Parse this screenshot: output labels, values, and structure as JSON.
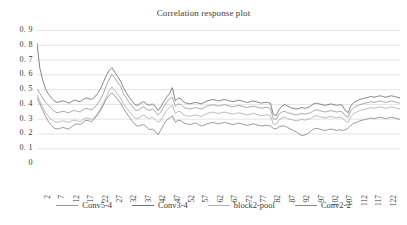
{
  "chart_data": {
    "type": "line",
    "title": "Correlation response plot",
    "xlabel": "",
    "ylabel": "",
    "ylim": [
      0,
      0.9
    ],
    "ytick_step": 0.1,
    "ytick_labels": [
      "0. 9",
      "0. 8",
      "0. 7",
      "0. 6",
      "0. 5",
      "0. 4",
      "0. 3",
      "0. 2",
      "0. 1",
      "0"
    ],
    "ytick_values": [
      0.9,
      0.8,
      0.7,
      0.6,
      0.5,
      0.4,
      0.3,
      0.2,
      0.1,
      0
    ],
    "grid": true,
    "grid_axis": "y",
    "legend_position": "bottom",
    "x_start": 1,
    "x_count": 127,
    "xtick_labels": [
      "2",
      "7",
      "12",
      "17",
      "22",
      "27",
      "32",
      "37",
      "42",
      "47",
      "52",
      "57",
      "62",
      "67",
      "72",
      "77",
      "82",
      "87",
      "92",
      "97",
      "102",
      "107",
      "112",
      "117",
      "122"
    ],
    "xtick_values": [
      2,
      7,
      12,
      17,
      22,
      27,
      32,
      37,
      42,
      47,
      52,
      57,
      62,
      67,
      72,
      77,
      82,
      87,
      92,
      97,
      102,
      107,
      112,
      117,
      122
    ],
    "series": [
      {
        "name": "Conv5-4",
        "color": "#9a9a9a",
        "values": [
          0.5,
          0.47,
          0.44,
          0.41,
          0.39,
          0.37,
          0.35,
          0.34,
          0.345,
          0.35,
          0.345,
          0.34,
          0.35,
          0.355,
          0.35,
          0.345,
          0.36,
          0.37,
          0.365,
          0.36,
          0.375,
          0.4,
          0.43,
          0.47,
          0.52,
          0.565,
          0.6,
          0.575,
          0.545,
          0.52,
          0.47,
          0.44,
          0.41,
          0.385,
          0.36,
          0.355,
          0.37,
          0.38,
          0.365,
          0.355,
          0.365,
          0.35,
          0.325,
          0.345,
          0.38,
          0.41,
          0.435,
          0.445,
          0.385,
          0.4,
          0.395,
          0.375,
          0.37,
          0.365,
          0.37,
          0.375,
          0.37,
          0.365,
          0.375,
          0.385,
          0.39,
          0.395,
          0.39,
          0.385,
          0.39,
          0.395,
          0.39,
          0.385,
          0.38,
          0.385,
          0.39,
          0.385,
          0.38,
          0.375,
          0.38,
          0.385,
          0.38,
          0.375,
          0.37,
          0.375,
          0.375,
          0.37,
          0.3,
          0.295,
          0.33,
          0.345,
          0.35,
          0.34,
          0.335,
          0.33,
          0.325,
          0.33,
          0.335,
          0.33,
          0.335,
          0.34,
          0.355,
          0.36,
          0.355,
          0.35,
          0.345,
          0.35,
          0.355,
          0.35,
          0.345,
          0.35,
          0.345,
          0.32,
          0.31,
          0.355,
          0.375,
          0.385,
          0.395,
          0.4,
          0.405,
          0.41,
          0.415,
          0.41,
          0.415,
          0.42,
          0.415,
          0.41,
          0.415,
          0.42,
          0.415,
          0.41,
          0.405
        ]
      },
      {
        "name": "Conv3-4",
        "color": "#707070",
        "values": [
          0.81,
          0.64,
          0.56,
          0.5,
          0.465,
          0.44,
          0.42,
          0.41,
          0.415,
          0.42,
          0.415,
          0.405,
          0.415,
          0.425,
          0.42,
          0.415,
          0.43,
          0.44,
          0.435,
          0.43,
          0.445,
          0.47,
          0.5,
          0.545,
          0.59,
          0.625,
          0.645,
          0.615,
          0.585,
          0.555,
          0.51,
          0.475,
          0.445,
          0.42,
          0.395,
          0.39,
          0.405,
          0.415,
          0.4,
          0.39,
          0.4,
          0.385,
          0.355,
          0.38,
          0.415,
          0.445,
          0.47,
          0.51,
          0.42,
          0.44,
          0.435,
          0.41,
          0.405,
          0.4,
          0.405,
          0.41,
          0.405,
          0.4,
          0.41,
          0.42,
          0.425,
          0.43,
          0.425,
          0.42,
          0.425,
          0.43,
          0.425,
          0.42,
          0.415,
          0.42,
          0.425,
          0.42,
          0.415,
          0.41,
          0.415,
          0.42,
          0.415,
          0.41,
          0.405,
          0.41,
          0.41,
          0.405,
          0.33,
          0.32,
          0.36,
          0.385,
          0.395,
          0.385,
          0.375,
          0.37,
          0.365,
          0.37,
          0.375,
          0.37,
          0.375,
          0.385,
          0.4,
          0.405,
          0.4,
          0.395,
          0.39,
          0.395,
          0.4,
          0.395,
          0.39,
          0.395,
          0.39,
          0.355,
          0.34,
          0.39,
          0.41,
          0.42,
          0.43,
          0.435,
          0.44,
          0.445,
          0.45,
          0.445,
          0.45,
          0.455,
          0.45,
          0.445,
          0.45,
          0.455,
          0.45,
          0.445,
          0.44
        ]
      },
      {
        "name": "block2-pool",
        "color": "#b0b0b0",
        "values": [
          0.46,
          0.42,
          0.38,
          0.34,
          0.315,
          0.295,
          0.28,
          0.275,
          0.28,
          0.285,
          0.28,
          0.275,
          0.285,
          0.29,
          0.285,
          0.28,
          0.295,
          0.305,
          0.3,
          0.295,
          0.31,
          0.335,
          0.365,
          0.4,
          0.445,
          0.485,
          0.515,
          0.49,
          0.465,
          0.44,
          0.4,
          0.375,
          0.35,
          0.325,
          0.305,
          0.3,
          0.315,
          0.325,
          0.31,
          0.3,
          0.31,
          0.295,
          0.275,
          0.29,
          0.325,
          0.355,
          0.375,
          0.39,
          0.335,
          0.35,
          0.345,
          0.325,
          0.32,
          0.315,
          0.32,
          0.325,
          0.32,
          0.315,
          0.325,
          0.335,
          0.34,
          0.345,
          0.34,
          0.335,
          0.34,
          0.345,
          0.34,
          0.335,
          0.33,
          0.335,
          0.34,
          0.335,
          0.33,
          0.325,
          0.33,
          0.335,
          0.33,
          0.325,
          0.32,
          0.325,
          0.325,
          0.32,
          0.265,
          0.26,
          0.29,
          0.305,
          0.31,
          0.3,
          0.295,
          0.29,
          0.285,
          0.29,
          0.295,
          0.29,
          0.295,
          0.3,
          0.315,
          0.32,
          0.315,
          0.31,
          0.305,
          0.31,
          0.315,
          0.31,
          0.305,
          0.31,
          0.305,
          0.285,
          0.275,
          0.315,
          0.335,
          0.345,
          0.355,
          0.36,
          0.365,
          0.37,
          0.375,
          0.37,
          0.375,
          0.38,
          0.375,
          0.37,
          0.375,
          0.38,
          0.375,
          0.37,
          0.365
        ]
      },
      {
        "name": "Conv2-2",
        "color": "#888888",
        "values": [
          0.44,
          0.4,
          0.355,
          0.315,
          0.28,
          0.255,
          0.235,
          0.23,
          0.235,
          0.24,
          0.235,
          0.23,
          0.245,
          0.26,
          0.265,
          0.26,
          0.275,
          0.29,
          0.285,
          0.28,
          0.3,
          0.325,
          0.355,
          0.39,
          0.43,
          0.455,
          0.475,
          0.455,
          0.43,
          0.405,
          0.37,
          0.34,
          0.31,
          0.285,
          0.26,
          0.25,
          0.255,
          0.26,
          0.245,
          0.225,
          0.23,
          0.215,
          0.19,
          0.225,
          0.26,
          0.29,
          0.305,
          0.32,
          0.275,
          0.29,
          0.285,
          0.27,
          0.265,
          0.26,
          0.265,
          0.27,
          0.26,
          0.25,
          0.255,
          0.265,
          0.27,
          0.275,
          0.27,
          0.265,
          0.27,
          0.275,
          0.27,
          0.265,
          0.26,
          0.265,
          0.27,
          0.265,
          0.26,
          0.255,
          0.26,
          0.265,
          0.26,
          0.255,
          0.25,
          0.255,
          0.255,
          0.25,
          0.235,
          0.23,
          0.245,
          0.25,
          0.25,
          0.24,
          0.23,
          0.22,
          0.21,
          0.195,
          0.185,
          0.19,
          0.2,
          0.215,
          0.23,
          0.235,
          0.23,
          0.225,
          0.22,
          0.225,
          0.23,
          0.225,
          0.22,
          0.225,
          0.22,
          0.225,
          0.235,
          0.255,
          0.27,
          0.275,
          0.285,
          0.29,
          0.295,
          0.3,
          0.305,
          0.3,
          0.305,
          0.31,
          0.305,
          0.3,
          0.305,
          0.31,
          0.305,
          0.3,
          0.295
        ]
      }
    ]
  },
  "legend": {
    "items": [
      {
        "label": "Conv5-4"
      },
      {
        "label": "Conv3-4"
      },
      {
        "label": "block2-pool"
      },
      {
        "label": "Conv2-2"
      }
    ]
  },
  "colors": {
    "grid": "#d9d9d9",
    "text": "#3b3b3b",
    "background": "#ffffff"
  }
}
